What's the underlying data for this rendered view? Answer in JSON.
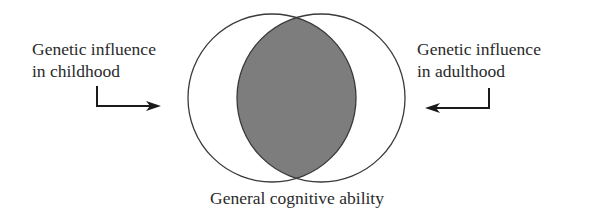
{
  "diagram": {
    "type": "venn",
    "left_label": {
      "line1": "Genetic influence",
      "line2": "in childhood"
    },
    "right_label": {
      "line1": "Genetic influence",
      "line2": "in adulthood"
    },
    "bottom_label": "General cognitive ability",
    "colors": {
      "stroke": "#3a3a3a",
      "overlap_fill": "#7d7d7d",
      "background": "#ffffff",
      "text": "#2a2a2a"
    }
  }
}
